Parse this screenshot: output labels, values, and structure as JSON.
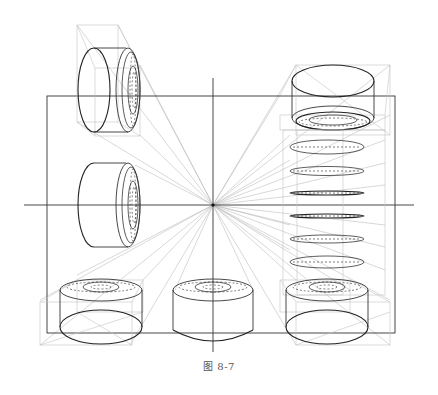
{
  "figure": {
    "caption": "图 8-7",
    "vanishing_point": {
      "x": 213,
      "y": 205
    },
    "horizon_line_y": 205,
    "picture_frame": {
      "x": 47,
      "y": 96,
      "width": 348,
      "height": 237
    },
    "colors": {
      "line": "#333333",
      "guide": "#c4c4c4",
      "ray": "#b0b0b0",
      "background": "#ffffff"
    },
    "objects": [
      {
        "id": "top-left-cylinder",
        "orientation": "axis horizontal, face toward right"
      },
      {
        "id": "mid-left-cylinder",
        "orientation": "axis horizontal, face toward right"
      },
      {
        "id": "top-right-cylinder",
        "orientation": "axis vertical, viewed from below"
      },
      {
        "id": "bottom-left-cylinder",
        "orientation": "axis vertical, viewed from above"
      },
      {
        "id": "bottom-center-cylinder",
        "orientation": "axis vertical, viewed from above"
      },
      {
        "id": "bottom-right-cylinder",
        "orientation": "axis vertical, viewed from above"
      },
      {
        "id": "right-column-sections",
        "count": 8,
        "orientation": "horizontal ellipse sections stacked along a vertical column"
      }
    ]
  }
}
